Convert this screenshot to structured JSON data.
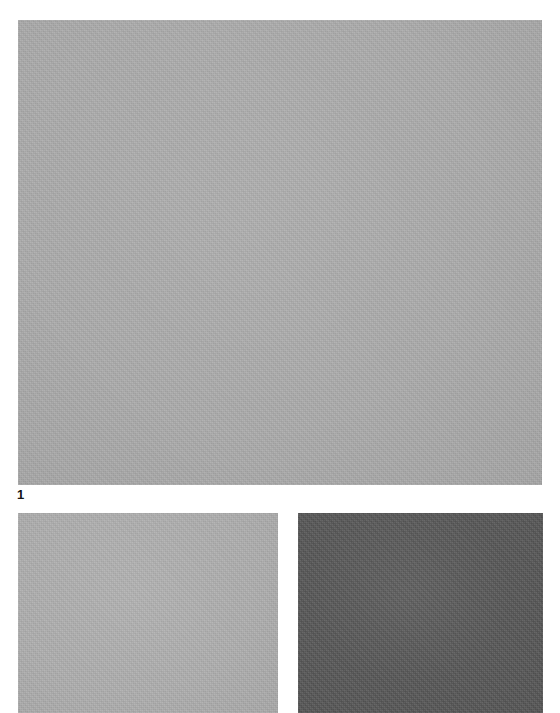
{
  "figure": {
    "number_label": "1",
    "background_color": "#ffffff",
    "page_width": 560,
    "page_height": 713
  },
  "panels": [
    {
      "id": "top",
      "name": "gray-swatch-large",
      "color": "#ababab",
      "label": "",
      "x": 18,
      "y": 20,
      "width": 524,
      "height": 465
    },
    {
      "id": "bottom-left",
      "name": "gray-swatch-light",
      "color": "#aeaeae",
      "label": "",
      "x": 18,
      "y": 513,
      "width": 260,
      "height": 200
    },
    {
      "id": "bottom-right",
      "name": "gray-swatch-dark",
      "color": "#565656",
      "label": "",
      "x": 298,
      "y": 513,
      "width": 245,
      "height": 200
    }
  ]
}
